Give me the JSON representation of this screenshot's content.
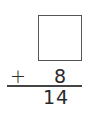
{
  "problem": {
    "unknown_addend": "",
    "operator": "+",
    "known_addend": "8",
    "sum": "14"
  }
}
